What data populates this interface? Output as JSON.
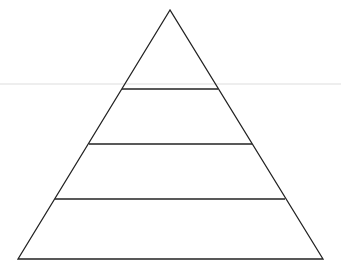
{
  "diagram": {
    "type": "pyramid",
    "levels": 4,
    "labels": [],
    "colors": {
      "stroke": "#222222",
      "background": "#ffffff",
      "guide_line": "#e6e6e6"
    }
  }
}
